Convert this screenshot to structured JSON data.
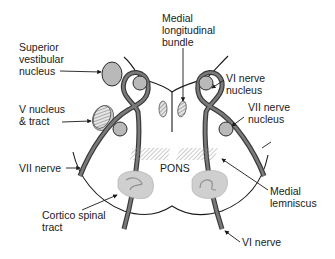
{
  "diagram": {
    "center_label": "PONS",
    "labels": {
      "medial_longitudinal_bundle": [
        "Medial",
        "longitudinal",
        "bundle"
      ],
      "superior_vestibular_nucleus": [
        "Superior",
        "vestibular",
        "nucleus"
      ],
      "v_nucleus_tract": [
        "V nucleus",
        "& tract"
      ],
      "vi_nerve_nucleus": [
        "VI nerve",
        "nucleus"
      ],
      "vii_nerve_nucleus": [
        "VII nerve",
        "nucleus"
      ],
      "vii_nerve": "VII nerve",
      "cortico_spinal_tract": [
        "Cortico spinal",
        "tract"
      ],
      "medial_lemniscus": [
        "Medial",
        "lemniscus"
      ],
      "vi_nerve": "VI nerve"
    },
    "colors": {
      "outline": "#1a1a1a",
      "nerve": "#3a3a3a",
      "nerve_core": "#7a7a7a",
      "nucleus_fill": "#b9b9b9",
      "tract_fill": "#cfcfcf"
    }
  }
}
